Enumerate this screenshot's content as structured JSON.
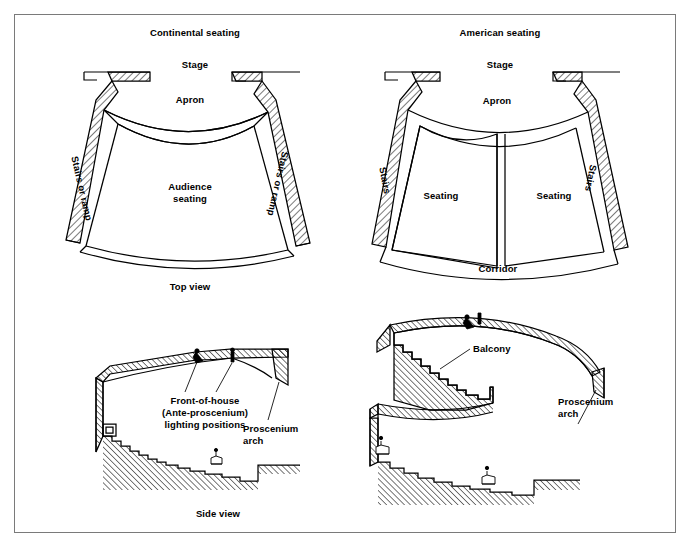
{
  "figure": {
    "background": "#ffffff",
    "line_color": "#000000",
    "frame_color": "#7a7a7a"
  },
  "panels": {
    "top_left": {
      "title": "Continental seating",
      "stage_label": "Stage",
      "apron_label": "Apron",
      "seating_label_line1": "Audience",
      "seating_label_line2": "seating",
      "left_access_label": "Stairs or ramp",
      "right_access_label": "Stairs or ramp"
    },
    "top_right": {
      "title": "American seating",
      "stage_label": "Stage",
      "apron_label": "Apron",
      "seating_label_left": "Seating",
      "seating_label_right": "Seating",
      "left_access_label": "Stairs",
      "right_access_label": "Stairs",
      "corridor_label": "Corridor"
    },
    "view_captions": {
      "top": "Top view",
      "side": "Side view"
    },
    "bottom_left": {
      "lighting_label_line1": "Front-of-house",
      "lighting_label_line2": "(Ante-proscenium)",
      "lighting_label_line3": "lighting positions",
      "proscenium_label_line1": "Proscenium",
      "proscenium_label_line2": "arch"
    },
    "bottom_right": {
      "balcony_label": "Balcony",
      "proscenium_label_line1": "Proscenium",
      "proscenium_label_line2": "arch"
    }
  }
}
